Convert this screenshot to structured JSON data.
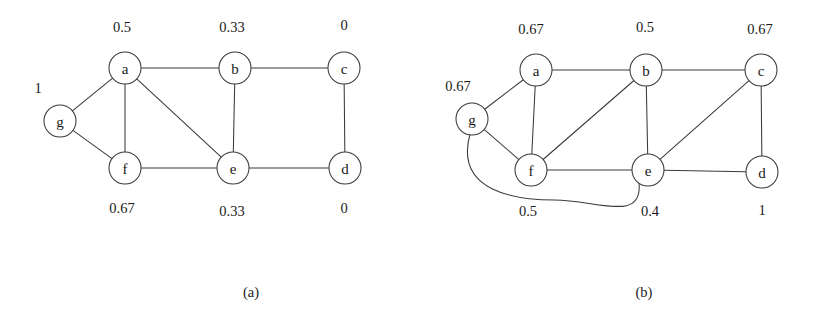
{
  "figure": {
    "background": "#ffffff",
    "ink": "#3a3a3a",
    "panels": [
      {
        "caption": "(a)",
        "caption_pos": {
          "x": 251,
          "y": 292
        },
        "nodes": [
          {
            "id": "a",
            "label": "a",
            "x": 125,
            "y": 68,
            "r": 16
          },
          {
            "id": "b",
            "label": "b",
            "x": 235,
            "y": 68,
            "r": 16
          },
          {
            "id": "c",
            "label": "c",
            "x": 344,
            "y": 68,
            "r": 16
          },
          {
            "id": "g",
            "label": "g",
            "x": 60,
            "y": 121,
            "r": 16
          },
          {
            "id": "f",
            "label": "f",
            "x": 125,
            "y": 168,
            "r": 16
          },
          {
            "id": "e",
            "label": "e",
            "x": 233,
            "y": 168,
            "r": 16
          },
          {
            "id": "d",
            "label": "d",
            "x": 345,
            "y": 168,
            "r": 16
          }
        ],
        "edges": [
          {
            "from": "a",
            "to": "b",
            "curved": false
          },
          {
            "from": "b",
            "to": "c",
            "curved": false
          },
          {
            "from": "c",
            "to": "d",
            "curved": false
          },
          {
            "from": "b",
            "to": "e",
            "curved": false
          },
          {
            "from": "a",
            "to": "e",
            "curved": false
          },
          {
            "from": "a",
            "to": "f",
            "curved": false
          },
          {
            "from": "f",
            "to": "e",
            "curved": false
          },
          {
            "from": "e",
            "to": "d",
            "curved": false
          },
          {
            "from": "g",
            "to": "a",
            "curved": false
          },
          {
            "from": "g",
            "to": "f",
            "curved": false
          }
        ],
        "values": [
          {
            "node": "a",
            "text": "0.5",
            "x": 122,
            "y": 27
          },
          {
            "node": "b",
            "text": "0.33",
            "x": 232,
            "y": 27
          },
          {
            "node": "c",
            "text": "0",
            "x": 344,
            "y": 25
          },
          {
            "node": "g",
            "text": "1",
            "x": 38,
            "y": 88
          },
          {
            "node": "f",
            "text": "0.67",
            "x": 122,
            "y": 208
          },
          {
            "node": "e",
            "text": "0.33",
            "x": 232,
            "y": 211
          },
          {
            "node": "d",
            "text": "0",
            "x": 344,
            "y": 208
          }
        ]
      },
      {
        "caption": "(b)",
        "caption_pos": {
          "x": 644,
          "y": 292
        },
        "nodes": [
          {
            "id": "a",
            "label": "a",
            "x": 536,
            "y": 70,
            "r": 16
          },
          {
            "id": "b",
            "label": "b",
            "x": 646,
            "y": 70,
            "r": 16
          },
          {
            "id": "c",
            "label": "c",
            "x": 761,
            "y": 70,
            "r": 16
          },
          {
            "id": "g",
            "label": "g",
            "x": 472,
            "y": 119,
            "r": 16
          },
          {
            "id": "f",
            "label": "f",
            "x": 531,
            "y": 170,
            "r": 16
          },
          {
            "id": "e",
            "label": "e",
            "x": 648,
            "y": 170,
            "r": 16
          },
          {
            "id": "d",
            "label": "d",
            "x": 762,
            "y": 172,
            "r": 16
          }
        ],
        "edges": [
          {
            "from": "a",
            "to": "b",
            "curved": false
          },
          {
            "from": "b",
            "to": "c",
            "curved": false
          },
          {
            "from": "a",
            "to": "f",
            "curved": false
          },
          {
            "from": "b",
            "to": "f",
            "curved": false
          },
          {
            "from": "b",
            "to": "e",
            "curved": false
          },
          {
            "from": "c",
            "to": "e",
            "curved": false
          },
          {
            "from": "c",
            "to": "d",
            "curved": false
          },
          {
            "from": "f",
            "to": "e",
            "curved": false
          },
          {
            "from": "e",
            "to": "d",
            "curved": false
          },
          {
            "from": "g",
            "to": "a",
            "curved": false
          },
          {
            "from": "g",
            "to": "f",
            "curved": false
          },
          {
            "from": "g",
            "to": "e",
            "curved": true,
            "sweep": 148
          }
        ],
        "values": [
          {
            "node": "a",
            "text": "0.67",
            "x": 531,
            "y": 29
          },
          {
            "node": "b",
            "text": "0.5",
            "x": 645,
            "y": 27
          },
          {
            "node": "c",
            "text": "0.67",
            "x": 760,
            "y": 29
          },
          {
            "node": "g",
            "text": "0.67",
            "x": 458,
            "y": 86
          },
          {
            "node": "f",
            "text": "0.5",
            "x": 528,
            "y": 211
          },
          {
            "node": "e",
            "text": "0.4",
            "x": 650,
            "y": 211
          },
          {
            "node": "d",
            "text": "1",
            "x": 762,
            "y": 210
          }
        ]
      }
    ]
  }
}
